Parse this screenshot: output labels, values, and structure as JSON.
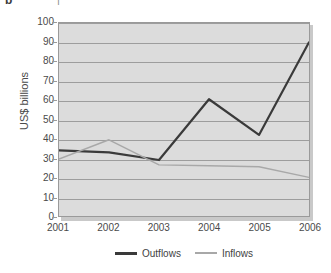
{
  "caption_remnant": {
    "left_glyph": "b",
    "right_glyph": "|"
  },
  "chart_data": {
    "type": "line",
    "title": "",
    "subtitle": "",
    "xlabel": "",
    "ylabel": "US$ billions",
    "categories": [
      "2001",
      "2002",
      "2003",
      "2004",
      "2005",
      "2006"
    ],
    "series": [
      {
        "name": "Outflows",
        "color": "#3a3a3a",
        "line_width": 2.2,
        "values": [
          34,
          33,
          29,
          60.5,
          42,
          90
        ]
      },
      {
        "name": "Inflows",
        "color": "#a8a8a8",
        "line_width": 1.4,
        "values": [
          29.5,
          39.5,
          26.5,
          26,
          25.5,
          20
        ]
      }
    ],
    "ylim": [
      0,
      100
    ],
    "yticks": [
      0,
      10,
      20,
      30,
      40,
      50,
      60,
      70,
      80,
      90,
      100
    ],
    "ytick_labels": [
      "0",
      "10",
      "20",
      "30",
      "40",
      "50",
      "60",
      "70",
      "80",
      "90",
      "100"
    ],
    "grid": true,
    "grid_axis": "y",
    "legend_position": "bottom",
    "plot_background": "#dcdcdc",
    "grid_color": "#9d9d9d",
    "axis_color": "#9a9a9a",
    "text_color": "#4a4a4a"
  }
}
